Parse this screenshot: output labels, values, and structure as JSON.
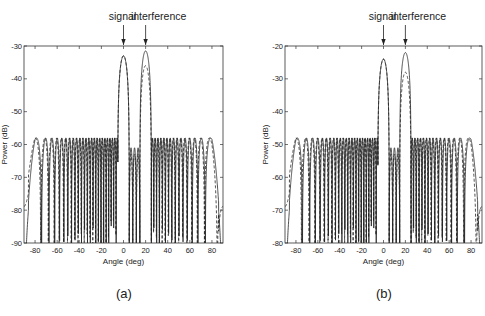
{
  "chart_data": [
    {
      "type": "line",
      "panel_label": "(a)",
      "title": "",
      "xlabel": "Angle (deg)",
      "ylabel": "Power (dB)",
      "xlim": [
        -90,
        90
      ],
      "ylim": [
        -90,
        -30
      ],
      "xticks": [
        -80,
        -60,
        -40,
        -20,
        0,
        20,
        40,
        60,
        80
      ],
      "yticks": [
        -30,
        -40,
        -50,
        -60,
        -70,
        -80,
        -90
      ],
      "grid": false,
      "annotations": [
        {
          "text": "signal",
          "x": 0,
          "arrow": true
        },
        {
          "text": "interference",
          "x": 20,
          "arrow": true
        }
      ],
      "series": [
        {
          "name": "solid",
          "style": "solid",
          "signal_peak_db": -33,
          "interference_peak_db": -31.5,
          "sidelobe_level_db": -58,
          "edge_level_db": -66
        },
        {
          "name": "dashed",
          "style": "dashed",
          "signal_peak_db": -33,
          "interference_peak_db": -36,
          "sidelobe_level_db": -58,
          "edge_level_db": -69
        }
      ],
      "main_lobes": [
        {
          "angle": 0,
          "label": "signal",
          "solid_db": -33,
          "dashed_db": -33
        },
        {
          "angle": 20,
          "label": "interference",
          "solid_db": -31.5,
          "dashed_db": -36
        }
      ]
    },
    {
      "type": "line",
      "panel_label": "(b)",
      "title": "",
      "xlabel": "Angle (deg)",
      "ylabel": "Power (dB)",
      "xlim": [
        -90,
        90
      ],
      "ylim": [
        -80,
        -20
      ],
      "xticks": [
        -80,
        -60,
        -40,
        -20,
        0,
        20,
        40,
        60,
        80
      ],
      "yticks": [
        -20,
        -30,
        -40,
        -50,
        -60,
        -70,
        -80
      ],
      "grid": false,
      "annotations": [
        {
          "text": "signal",
          "x": 0,
          "arrow": true
        },
        {
          "text": "interference",
          "x": 20,
          "arrow": true
        }
      ],
      "series": [
        {
          "name": "solid",
          "style": "solid",
          "signal_peak_db": -24,
          "interference_peak_db": -22,
          "sidelobe_level_db": -48,
          "edge_level_db": -56
        },
        {
          "name": "dashed",
          "style": "dashed",
          "signal_peak_db": -24,
          "interference_peak_db": -28,
          "sidelobe_level_db": -48,
          "edge_level_db": -59
        }
      ],
      "main_lobes": [
        {
          "angle": 0,
          "label": "signal",
          "solid_db": -24,
          "dashed_db": -24
        },
        {
          "angle": 20,
          "label": "interference",
          "solid_db": -22,
          "dashed_db": -28
        }
      ]
    }
  ],
  "panels": {
    "a": {
      "label": "(a)",
      "signal": "signal",
      "interference": "interference",
      "xlabel": "Angle (deg)",
      "ylabel": "Power (dB)"
    },
    "b": {
      "label": "(b)",
      "signal": "signal",
      "interference": "interference",
      "xlabel": "Angle (deg)",
      "ylabel": "Power (dB)"
    }
  },
  "colors": {
    "line": "#222222",
    "axis": "#333333",
    "background": "#ffffff"
  }
}
